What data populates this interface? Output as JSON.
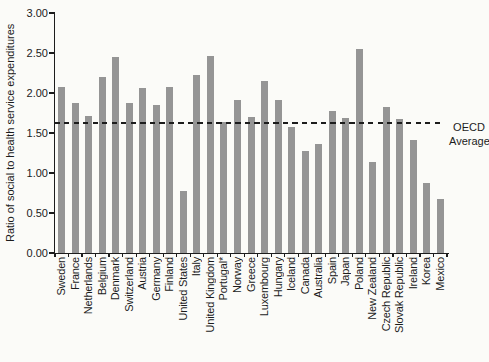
{
  "figure": {
    "background": "#fbfbf8",
    "oecd_label_line1": "OECD",
    "oecd_label_line2": "Average"
  },
  "chart_data": {
    "type": "bar",
    "title": "",
    "xlabel": "",
    "ylabel": "Ratio of social to health service expenditures",
    "ylim": [
      0,
      3.0
    ],
    "ytick_labels": [
      "0.00",
      "0.50",
      "1.00",
      "1.50",
      "2.00",
      "2.50",
      "3.00"
    ],
    "grid": false,
    "legend": "none",
    "bar_color": "#959595",
    "categories": [
      "Sweden",
      "France",
      "Netherlands",
      "Belgium",
      "Denmark",
      "Switzerland",
      "Austria",
      "Germany",
      "Finland",
      "United States",
      "Italy",
      "United Kingdom",
      "Portugal*",
      "Norway",
      "Greece",
      "Luxembourg",
      "Hungary",
      "Iceland",
      "Canada",
      "Australia",
      "Spain",
      "Japan",
      "Poland",
      "New Zealand",
      "Czech Republic",
      "Slovak Republic",
      "Ireland",
      "Korea",
      "Mexico"
    ],
    "values": [
      2.08,
      1.87,
      1.71,
      2.2,
      2.45,
      1.88,
      2.06,
      1.85,
      2.07,
      0.77,
      2.22,
      2.46,
      1.64,
      1.91,
      1.7,
      2.15,
      1.91,
      1.57,
      1.27,
      1.36,
      1.78,
      1.69,
      2.55,
      1.14,
      1.82,
      1.68,
      1.41,
      0.87,
      0.68
    ],
    "reference_line": {
      "value": 1.62,
      "label": "OECD Average",
      "style": "dashed",
      "color": "#1c1c1c"
    }
  }
}
